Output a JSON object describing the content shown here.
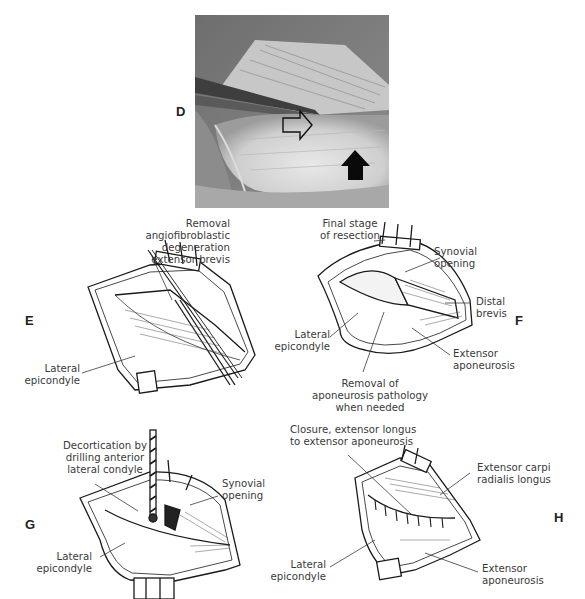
{
  "figure": {
    "panels": [
      {
        "id": "D",
        "type": "photograph",
        "description": "Intraoperative photograph of lateral elbow showing exposed extensor tendons",
        "annotations": [
          {
            "name": "open-arrow",
            "style": "outlined",
            "direction": "right"
          },
          {
            "name": "solid-arrow",
            "style": "filled-black",
            "direction": "up"
          }
        ]
      },
      {
        "id": "E",
        "type": "illustration",
        "labels": [
          {
            "lines": [
              "Removal",
              "angiofibroblastic",
              "degeneration",
              "extensor brevis"
            ]
          },
          {
            "lines": [
              "Lateral",
              "epicondyle"
            ]
          }
        ]
      },
      {
        "id": "F",
        "type": "illustration",
        "labels": [
          {
            "lines": [
              "Final stage",
              "of resection"
            ]
          },
          {
            "lines": [
              "Synovial",
              "opening"
            ]
          },
          {
            "lines": [
              "Distal",
              "brevis"
            ]
          },
          {
            "lines": [
              "Lateral",
              "epicondyle"
            ]
          },
          {
            "lines": [
              "Extensor",
              "aponeurosis"
            ]
          },
          {
            "lines": [
              "Removal of",
              "aponeurosis pathology",
              "when needed"
            ]
          }
        ]
      },
      {
        "id": "G",
        "type": "illustration",
        "labels": [
          {
            "lines": [
              "Decortication by",
              "drilling anterior",
              "lateral condyle"
            ]
          },
          {
            "lines": [
              "Synovial",
              "opening"
            ]
          },
          {
            "lines": [
              "Lateral",
              "epicondyle"
            ]
          }
        ]
      },
      {
        "id": "H",
        "type": "illustration",
        "labels": [
          {
            "lines": [
              "Closure, extensor longus",
              "to extensor aponeurosis"
            ]
          },
          {
            "lines": [
              "Extensor carpi",
              "radialis longus"
            ]
          },
          {
            "lines": [
              "Lateral",
              "epicondyle"
            ]
          },
          {
            "lines": [
              "Extensor",
              "aponeurosis"
            ]
          }
        ]
      }
    ]
  },
  "colors": {
    "ink": "#1a1a1a",
    "label_text": "#3a3a3a",
    "background": "#ffffff",
    "photo_mid": "#9a9a9a"
  }
}
